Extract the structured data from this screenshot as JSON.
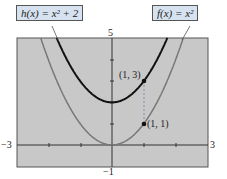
{
  "chart_data": {
    "type": "line",
    "title": "",
    "xlabel": "",
    "ylabel": "",
    "xlim": [
      -3,
      3
    ],
    "ylim": [
      -1,
      5
    ],
    "grid": false,
    "tick_labels": {
      "xmin": "−3",
      "xmax": "3",
      "ymax": "5",
      "ymin": "−1"
    },
    "series": [
      {
        "name": "h(x) = x² + 2",
        "function": "x^2 + 2",
        "color": "#111111",
        "x": [
          -1.75,
          -1,
          0,
          1,
          1.75
        ],
        "values": [
          5.06,
          3,
          2,
          3,
          5.06
        ]
      },
      {
        "name": "f(x) = x²",
        "function": "x^2",
        "color": "#777777",
        "x": [
          -2.25,
          -1,
          0,
          1,
          2.25
        ],
        "values": [
          5.06,
          1,
          0,
          1,
          5.06
        ]
      }
    ],
    "annotations": [
      {
        "text": "(1, 3)",
        "x": 1,
        "y": 3
      },
      {
        "text": "(1, 1)",
        "x": 1,
        "y": 1
      }
    ],
    "legend": [
      {
        "text": "h(x) = x² + 2",
        "position": "top-left"
      },
      {
        "text": "f(x) = x²",
        "position": "top-right"
      }
    ]
  },
  "labels": {
    "h": "h(x) = x² + 2",
    "f": "f(x) = x²",
    "p13": "(1, 3)",
    "p11": "(1, 1)",
    "xmin": "−3",
    "xmax": "3",
    "ymax": "5",
    "ymin": "−1"
  }
}
